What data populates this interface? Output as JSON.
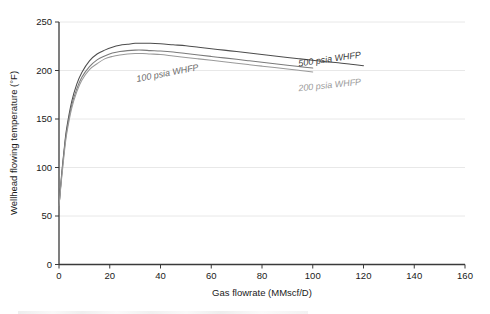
{
  "chart_data": {
    "type": "line",
    "title": "",
    "xlabel": "Gas flowrate (MMscf/D)",
    "ylabel": "Wellhead flowing temperature (°F)",
    "xlim": [
      0,
      160
    ],
    "ylim": [
      0,
      250
    ],
    "xticks": [
      0,
      20,
      40,
      60,
      80,
      100,
      120,
      140,
      160
    ],
    "yticks": [
      0,
      50,
      100,
      150,
      200,
      250
    ],
    "grid": "horizontal",
    "legend_position": "inline-annotations",
    "series": [
      {
        "name": "500 psia WHFP",
        "color": "#4d4d4d",
        "label_text": "500 psia WHFP",
        "x": [
          0,
          1,
          2,
          3,
          5,
          7,
          9,
          12,
          15,
          18,
          21,
          24,
          27,
          30,
          33,
          36,
          40,
          45,
          50,
          55,
          60,
          65,
          70,
          75,
          80,
          85,
          90,
          95,
          100,
          105,
          110,
          115,
          120
        ],
        "y": [
          60,
          92,
          118,
          140,
          168,
          186,
          198,
          210,
          217,
          221,
          224,
          226,
          227,
          228,
          228,
          228,
          227.5,
          226.5,
          225.5,
          224,
          222.5,
          221,
          219.5,
          218,
          216.5,
          215,
          213.5,
          212,
          210.5,
          209,
          208,
          206.5,
          205
        ]
      },
      {
        "name": "100 psia WHFP",
        "color": "#7a7a7a",
        "label_text": "100 psia WHFP",
        "x": [
          0,
          1,
          2,
          3,
          5,
          7,
          9,
          12,
          15,
          18,
          21,
          24,
          27,
          30,
          33,
          36,
          40,
          45,
          50,
          55,
          60,
          65,
          70,
          75,
          80,
          85,
          90,
          95,
          100
        ],
        "y": [
          60,
          90,
          116,
          137,
          164,
          181,
          193,
          204,
          211,
          215,
          218,
          219.5,
          220.5,
          221,
          221,
          220.5,
          220,
          219,
          217.5,
          216,
          214.5,
          213,
          211.5,
          210,
          208.5,
          207,
          205.5,
          204,
          202.5
        ]
      },
      {
        "name": "200 psia WHFP",
        "color": "#9a9a9a",
        "label_text": "200 psia WHFP",
        "x": [
          0,
          1,
          2,
          3,
          5,
          7,
          9,
          12,
          15,
          18,
          21,
          24,
          27,
          30,
          33,
          36,
          40,
          45,
          50,
          55,
          60,
          65,
          70,
          75,
          80,
          85,
          90,
          95,
          100
        ],
        "y": [
          60,
          88,
          113,
          134,
          161,
          178,
          190,
          201,
          207,
          212,
          214.5,
          216,
          217,
          217.5,
          217.5,
          217,
          216.5,
          215,
          213.5,
          212,
          210.5,
          209,
          207.5,
          206,
          204.5,
          203,
          201.5,
          200,
          198.5
        ]
      }
    ],
    "annotations": [
      {
        "text": "500 psia WHFP",
        "x_px": 330,
        "y_px": 62,
        "rotation": -8,
        "color": "#3a3a3a"
      },
      {
        "text": "200 psia WHFP",
        "x_px": 330,
        "y_px": 88,
        "rotation": -6,
        "color": "#9a9a9a"
      },
      {
        "text": "100 psia WHFP",
        "x_px": 168,
        "y_px": 76,
        "rotation": -11,
        "color": "#6a6a6a"
      }
    ]
  },
  "axes": {
    "y_tick_labels": [
      "0",
      "50",
      "100",
      "150",
      "200",
      "250"
    ],
    "x_tick_labels": [
      "0",
      "20",
      "40",
      "60",
      "80",
      "100",
      "120",
      "140",
      "160"
    ],
    "x_axis_title": "Gas flowrate (MMscf/D)",
    "y_axis_title": "Wellhead flowing temperature (°F)"
  }
}
